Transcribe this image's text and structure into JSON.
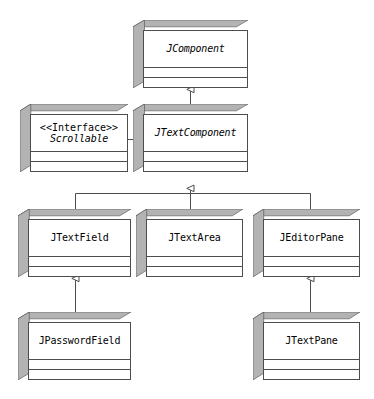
{
  "diagram": {
    "type": "uml-class-diagram",
    "background_color": "#ffffff",
    "box_fill_color": "#ffffff",
    "box_shade_color": "#b3b3b3",
    "box_line_color": "#4d4d4d",
    "connector_color": "#4d4d4d"
  },
  "classes": [
    {
      "id": "jcomponent",
      "name": "JComponent",
      "stereotype": "",
      "abstract": true,
      "x": 133,
      "y": 20,
      "w": 115,
      "h": 68
    },
    {
      "id": "scrollable",
      "name": "Scrollable",
      "stereotype": "<<Interface>>",
      "abstract": true,
      "x": 20,
      "y": 104,
      "w": 108,
      "h": 68
    },
    {
      "id": "jtextcomponent",
      "name": "JTextComponent",
      "stereotype": "",
      "abstract": true,
      "x": 133,
      "y": 104,
      "w": 115,
      "h": 68
    },
    {
      "id": "jtextfield",
      "name": "JTextField",
      "stereotype": "",
      "abstract": false,
      "x": 18,
      "y": 209,
      "w": 113,
      "h": 68
    },
    {
      "id": "jtextarea",
      "name": "JTextArea",
      "stereotype": "",
      "abstract": false,
      "x": 136,
      "y": 209,
      "w": 107,
      "h": 68
    },
    {
      "id": "jeditorpane",
      "name": "JEditorPane",
      "stereotype": "",
      "abstract": false,
      "x": 253,
      "y": 209,
      "w": 107,
      "h": 68
    },
    {
      "id": "jpasswordfield",
      "name": "JPasswordField",
      "stereotype": "",
      "abstract": false,
      "x": 18,
      "y": 312,
      "w": 113,
      "h": 68
    },
    {
      "id": "jtextpane",
      "name": "JTextPane",
      "stereotype": "",
      "abstract": false,
      "x": 253,
      "y": 312,
      "w": 107,
      "h": 68
    }
  ],
  "relations": [
    {
      "id": "rel-jtextcomponent-jcomponent",
      "kind": "generalization",
      "from": "JTextComponent",
      "to": "JComponent"
    },
    {
      "id": "rel-jtextcomponent-scrollable",
      "kind": "realization-link",
      "from": "JTextComponent",
      "to": "Scrollable"
    },
    {
      "id": "rel-jtextfield-jtextcomponent",
      "kind": "generalization",
      "from": "JTextField",
      "to": "JTextComponent"
    },
    {
      "id": "rel-jtextarea-jtextcomponent",
      "kind": "generalization",
      "from": "JTextArea",
      "to": "JTextComponent"
    },
    {
      "id": "rel-jeditorpane-jtextcomponent",
      "kind": "generalization",
      "from": "JEditorPane",
      "to": "JTextComponent"
    },
    {
      "id": "rel-jpasswordfield-jtextfield",
      "kind": "generalization",
      "from": "JPasswordField",
      "to": "JTextField"
    },
    {
      "id": "rel-jtextpane-jeditorpane",
      "kind": "generalization",
      "from": "JTextPane",
      "to": "JEditorPane"
    }
  ]
}
